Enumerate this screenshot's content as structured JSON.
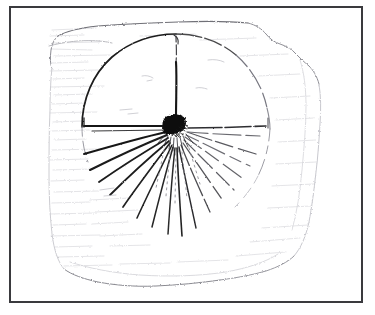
{
  "figure": {
    "kind": "scanned-line-drawing",
    "subject": "archaeological artifact fragment with incised radiating sunburst motif",
    "background_color": "#ffffff",
    "frame": {
      "name": "figure-border",
      "color": "#3a3a3e",
      "stroke_width": 2,
      "x": 9,
      "y": 6,
      "width": 354,
      "height": 297
    },
    "ink": {
      "dark": "#121212",
      "mid": "#555555",
      "faint": "#a8a8ad",
      "very_faint": "#d2d2d6"
    },
    "artifact_outline": {
      "name": "fragment-outline",
      "color": "#b4b4b9",
      "points": "58,36 70,30 96,27 128,24 168,23 206,21 238,22 262,26 276,34 288,46 300,54 312,62 318,76 320,96 318,120 318,146 314,172 310,196 308,218 302,236 292,250 276,262 252,272 224,280 196,285 166,287 136,286 110,283 88,278 72,270 62,258 56,242 52,220 50,196 50,170 50,144 50,118 51,92 53,66 55,48"
    },
    "motif": {
      "name": "sunburst-motif",
      "hub": {
        "name": "central-hub",
        "cx": 176,
        "cy": 127,
        "rx": 11,
        "ry": 10,
        "fill": "#101010"
      },
      "outer_arc": {
        "name": "outer-circle-arc",
        "cx": 176,
        "cy": 127,
        "r": 94,
        "note": "large circle, dark on upper-left quadrant, faint dashed on right"
      },
      "vertical_spoke": {
        "name": "vertical-spoke",
        "from": [
          176,
          34
        ],
        "to": [
          176,
          120
        ]
      },
      "ray_count": 18,
      "rays": [
        {
          "angle_deg": 180,
          "length": 94,
          "weight": "dark"
        },
        {
          "angle_deg": 193,
          "length": 96,
          "weight": "dark"
        },
        {
          "angle_deg": 205,
          "length": 100,
          "weight": "dark"
        },
        {
          "angle_deg": 216,
          "length": 104,
          "weight": "dark"
        },
        {
          "angle_deg": 227,
          "length": 108,
          "weight": "dark"
        },
        {
          "angle_deg": 238,
          "length": 116,
          "weight": "dark"
        },
        {
          "angle_deg": 248,
          "length": 126,
          "weight": "dark"
        },
        {
          "angle_deg": 258,
          "length": 133,
          "weight": "dark"
        },
        {
          "angle_deg": 268,
          "length": 136,
          "weight": "dark"
        },
        {
          "angle_deg": 278,
          "length": 134,
          "weight": "dark"
        },
        {
          "angle_deg": 288,
          "length": 128,
          "weight": "mid"
        },
        {
          "angle_deg": 298,
          "length": 120,
          "weight": "mid"
        },
        {
          "angle_deg": 308,
          "length": 112,
          "weight": "mid"
        },
        {
          "angle_deg": 318,
          "length": 104,
          "weight": "mid"
        },
        {
          "angle_deg": 328,
          "length": 100,
          "weight": "faint"
        },
        {
          "angle_deg": 338,
          "length": 98,
          "weight": "faint"
        },
        {
          "angle_deg": 349,
          "length": 96,
          "weight": "mid"
        },
        {
          "angle_deg": 0,
          "length": 94,
          "weight": "mid"
        }
      ]
    },
    "hatching": {
      "name": "background-hatching",
      "note": "faint horizontal scan texture in left and lower background",
      "color": "#dcdce0"
    }
  }
}
